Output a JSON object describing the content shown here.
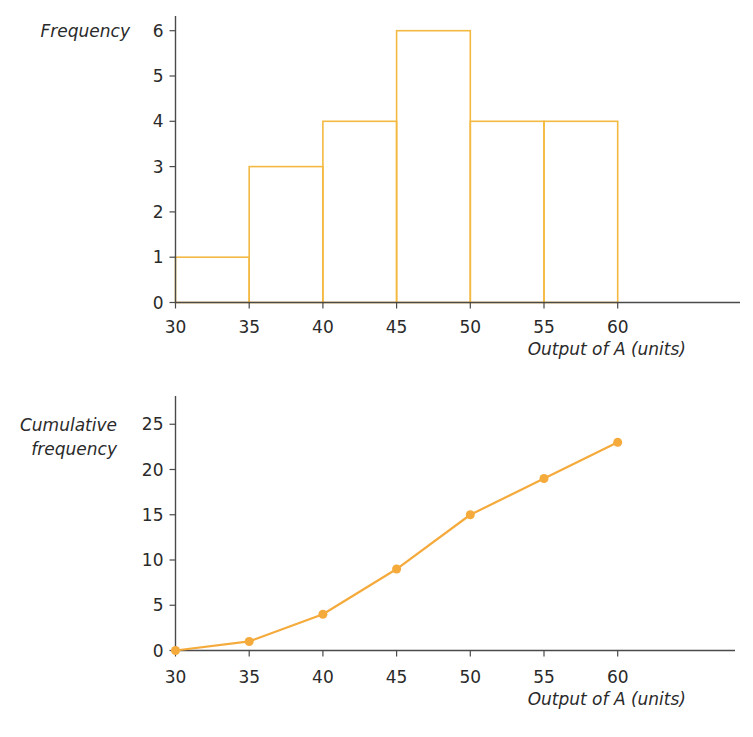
{
  "chart_data": [
    {
      "type": "bar",
      "subtype": "histogram",
      "title": "",
      "xlabel": "Output of A (units)",
      "ylabel": "Frequency",
      "bins": [
        [
          30,
          35
        ],
        [
          35,
          40
        ],
        [
          40,
          45
        ],
        [
          45,
          50
        ],
        [
          50,
          55
        ],
        [
          55,
          60
        ]
      ],
      "categories": [
        "30-35",
        "35-40",
        "40-45",
        "45-50",
        "50-55",
        "55-60"
      ],
      "values": [
        1,
        3,
        4,
        6,
        4,
        4
      ],
      "x_ticks": [
        30,
        35,
        40,
        45,
        50,
        55,
        60
      ],
      "y_ticks": [
        0,
        1,
        2,
        3,
        4,
        5,
        6
      ],
      "ylim": [
        0,
        6
      ],
      "grid": false,
      "legend": null,
      "bar_outline_color": "#f4b942",
      "bar_fill": "none"
    },
    {
      "type": "line",
      "subtype": "cumulative frequency",
      "title": "",
      "xlabel": "Output of A (units)",
      "ylabel": "Cumulative frequency",
      "x": [
        30,
        35,
        40,
        45,
        50,
        55,
        60
      ],
      "values": [
        0,
        1,
        4,
        9,
        15,
        19,
        23
      ],
      "x_ticks": [
        30,
        35,
        40,
        45,
        50,
        55,
        60
      ],
      "y_ticks": [
        0,
        5,
        10,
        15,
        20,
        25
      ],
      "ylim": [
        0,
        25
      ],
      "grid": false,
      "legend": null,
      "markers": true,
      "line_color": "#f5aa3c"
    }
  ],
  "histogram": {
    "ylabel": "Frequency",
    "xlabel": "Output of A (units)",
    "y_ticks": [
      "0",
      "1",
      "2",
      "3",
      "4",
      "5",
      "6"
    ],
    "x_ticks": [
      "30",
      "35",
      "40",
      "45",
      "50",
      "55",
      "60"
    ]
  },
  "ogive": {
    "ylabel_line1": "Cumulative",
    "ylabel_line2": "frequency",
    "xlabel": "Output of A (units)",
    "y_ticks": [
      "0",
      "5",
      "10",
      "15",
      "20",
      "25"
    ],
    "x_ticks": [
      "30",
      "35",
      "40",
      "45",
      "50",
      "55",
      "60"
    ]
  }
}
